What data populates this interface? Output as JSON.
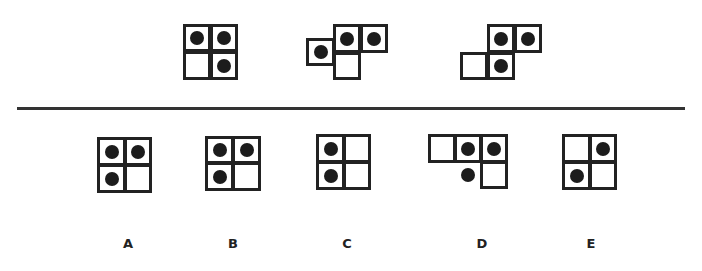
{
  "question": {
    "sequence": [
      {
        "id": "seq-1",
        "cells": [
          {
            "x": 183,
            "y": 24,
            "w": 28,
            "h": 28,
            "dot": true
          },
          {
            "x": 210,
            "y": 24,
            "w": 28,
            "h": 28,
            "dot": true
          },
          {
            "x": 183,
            "y": 51,
            "w": 28,
            "h": 29,
            "dot": false
          },
          {
            "x": 210,
            "y": 51,
            "w": 28,
            "h": 29,
            "dot": true
          }
        ],
        "free_dots": []
      },
      {
        "id": "seq-2",
        "cells": [
          {
            "x": 306,
            "y": 38,
            "w": 29,
            "h": 28,
            "dot": true
          },
          {
            "x": 333,
            "y": 24,
            "w": 28,
            "h": 29,
            "dot": true
          },
          {
            "x": 360,
            "y": 24,
            "w": 28,
            "h": 29,
            "dot": true
          },
          {
            "x": 333,
            "y": 52,
            "w": 28,
            "h": 28,
            "dot": false
          }
        ],
        "free_dots": []
      },
      {
        "id": "seq-3",
        "cells": [
          {
            "x": 487,
            "y": 24,
            "w": 28,
            "h": 29,
            "dot": true
          },
          {
            "x": 514,
            "y": 24,
            "w": 28,
            "h": 29,
            "dot": true
          },
          {
            "x": 460,
            "y": 52,
            "w": 28,
            "h": 28,
            "dot": false
          },
          {
            "x": 487,
            "y": 52,
            "w": 28,
            "h": 28,
            "dot": true
          }
        ],
        "free_dots": []
      }
    ]
  },
  "options": [
    {
      "label": "A",
      "label_x": 118,
      "cells": [
        {
          "x": 97,
          "y": 137,
          "w": 29,
          "h": 29,
          "dot": true
        },
        {
          "x": 124,
          "y": 137,
          "w": 28,
          "h": 29,
          "dot": true
        },
        {
          "x": 97,
          "y": 164,
          "w": 29,
          "h": 29,
          "dot": true
        },
        {
          "x": 124,
          "y": 164,
          "w": 28,
          "h": 29,
          "dot": false
        }
      ],
      "free_dots": []
    },
    {
      "label": "B",
      "label_x": 223,
      "cells": [
        {
          "x": 205,
          "y": 136,
          "w": 29,
          "h": 28,
          "dot": true
        },
        {
          "x": 232,
          "y": 136,
          "w": 29,
          "h": 28,
          "dot": true
        },
        {
          "x": 205,
          "y": 162,
          "w": 29,
          "h": 29,
          "dot": true
        },
        {
          "x": 232,
          "y": 162,
          "w": 29,
          "h": 29,
          "dot": false
        }
      ],
      "free_dots": []
    },
    {
      "label": "C",
      "label_x": 337,
      "cells": [
        {
          "x": 316,
          "y": 134,
          "w": 29,
          "h": 29,
          "dot": true
        },
        {
          "x": 343,
          "y": 134,
          "w": 28,
          "h": 29,
          "dot": false
        },
        {
          "x": 316,
          "y": 161,
          "w": 29,
          "h": 29,
          "dot": true
        },
        {
          "x": 343,
          "y": 161,
          "w": 28,
          "h": 29,
          "dot": false
        }
      ],
      "free_dots": []
    },
    {
      "label": "D",
      "label_x": 472,
      "cells": [
        {
          "x": 428,
          "y": 134,
          "w": 28,
          "h": 29,
          "dot": false
        },
        {
          "x": 454,
          "y": 134,
          "w": 28,
          "h": 29,
          "dot": true
        },
        {
          "x": 480,
          "y": 134,
          "w": 28,
          "h": 29,
          "dot": true
        },
        {
          "x": 480,
          "y": 161,
          "w": 28,
          "h": 28,
          "dot": false
        }
      ],
      "free_dots": [
        {
          "x": 461,
          "y": 168
        }
      ]
    },
    {
      "label": "E",
      "label_x": 581,
      "cells": [
        {
          "x": 562,
          "y": 134,
          "w": 29,
          "h": 29,
          "dot": false
        },
        {
          "x": 589,
          "y": 134,
          "w": 28,
          "h": 29,
          "dot": true
        },
        {
          "x": 562,
          "y": 161,
          "w": 29,
          "h": 29,
          "dot": true
        },
        {
          "x": 589,
          "y": 161,
          "w": 28,
          "h": 29,
          "dot": false
        }
      ],
      "free_dots": []
    }
  ],
  "colors": {
    "ink": "#222222",
    "dot": "#1c1c1c",
    "background": "#ffffff"
  }
}
